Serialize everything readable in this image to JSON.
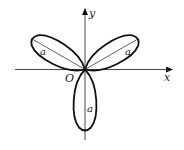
{
  "diagram": {
    "type": "polar-rose",
    "axes": {
      "x_label": "x",
      "y_label": "y",
      "origin_label": "O"
    },
    "petals": [
      {
        "name": "upper-left",
        "label": "a"
      },
      {
        "name": "upper-right",
        "label": "a"
      },
      {
        "name": "lower",
        "label": "a"
      }
    ],
    "colors": {
      "stroke": "#111111",
      "background": "#ffffff"
    }
  }
}
